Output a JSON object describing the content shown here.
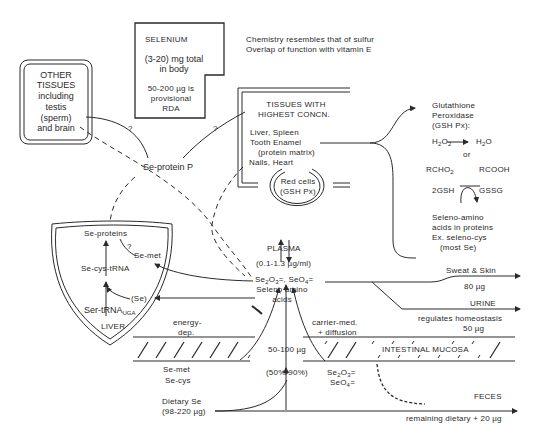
{
  "selenium_box": {
    "title": "SELENIUM",
    "total_line1": "(3-20) mg total",
    "total_line2": "in body",
    "rda_line1": "50-200 µg is",
    "rda_line2": "provisional",
    "rda_line3": "RDA"
  },
  "notes": {
    "line1": "Chemistry resembles that of sulfur",
    "line2": "Overlap of function with vitamin E"
  },
  "other_tissues": {
    "line1": "OTHER",
    "line2": "TISSUES",
    "line3": "including",
    "line4": "testis",
    "line5": "(sperm)",
    "line6": "and brain"
  },
  "question_marks": {
    "q1": "?",
    "q2": "?",
    "q3": "?"
  },
  "se_protein_p": "Se-protein P",
  "high_tissues": {
    "title1": "TISSUES WITH",
    "title2": "HIGHEST CONCN.",
    "item1": "Liver, Spleen",
    "item2": "Tooth Enamel",
    "item3": "(protein matrix)",
    "item4": "Nails, Heart",
    "red_cells1": "Red cells",
    "red_cells2": "(GSH Px)"
  },
  "functions": {
    "gshpx1": "Glutathione",
    "gshpx2": "Peroxidase",
    "gshpx3": "(GSH Px):",
    "h2o2": "H",
    "h2o2_sub1": "2",
    "h2o2_o": "O",
    "h2o2_sub2": "2",
    "h2o": "H",
    "h2o_sub": "2",
    "h2o_o": "O",
    "or": "or",
    "rcho2": "RCHO",
    "rcho2_sub": "2",
    "rcooh": "RCOOH",
    "gsh": "2GSH",
    "gssg": "GSSG",
    "seleno1": "Seleno-amino",
    "seleno2": "acids in proteins",
    "seleno3": "Ex. seleno-cys",
    "seleno4": "(most Se)"
  },
  "liver": {
    "se_proteins": "Se-proteins",
    "q": "?",
    "se_met": "Se-met",
    "se_cys_trna": "Se-cys-tRNA",
    "se": "(Se)",
    "ser_trna": "Ser-tRNA",
    "ser_trna_sub": "UGA",
    "label": "LIVER"
  },
  "plasma": {
    "label": "PLASMA",
    "conc": "(0.1-1.3 µg/ml)",
    "species_line2": "Seleno amino",
    "species_line3": "acids"
  },
  "excretion": {
    "sweat": "Sweat & Skin",
    "sweat_amt": "80 µg",
    "urine": "URINE",
    "urine_note": "regulates homeostasis",
    "urine_amt": "50 µg",
    "feces": "FECES",
    "feces_note": "remaining dietary + 20 µg"
  },
  "absorption": {
    "energy1": "energy-",
    "energy2": "dep.",
    "carrier1": "carrier-med.",
    "carrier2": "+ diffusion",
    "amount": "50-100 µg",
    "pct": "(50%-90%)",
    "mucosa": "INTESTINAL MUCOSA",
    "se_met": "Se-met",
    "se_cys": "Se-cys",
    "dietary1": "Dietary Se",
    "dietary2": "(98-220 µg)"
  },
  "colors": {
    "ink": "#2a2a2a",
    "background": "#ffffff"
  }
}
